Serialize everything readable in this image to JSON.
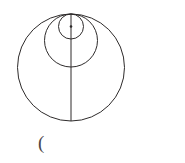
{
  "figure": {
    "caption_text": "(",
    "caption_x": 38,
    "caption_y": 133,
    "background_color": "#ffffff",
    "stroke_color": "#2e2b2b",
    "caption_color": "#4a4646"
  },
  "chart_data": {
    "type": "diagram",
    "title": "",
    "subtitle": "",
    "xlabel": "",
    "ylabel": "",
    "grid": false,
    "legend": null,
    "coordinate_space": {
      "width": 185,
      "height": 163,
      "origin": "top-left",
      "units": "pixels"
    },
    "tangent_point": {
      "label": "top tangent point",
      "x": 71,
      "y": 14
    },
    "circles": [
      {
        "name": "large-circle",
        "cx": 71,
        "cy": 67.5,
        "r": 53.5,
        "diameter": 107,
        "stroke_width": 1.0,
        "top_y": 14,
        "bottom_y": 121
      },
      {
        "name": "middle-circle",
        "cx": 71,
        "cy": 40.5,
        "r": 26.5,
        "diameter": 53,
        "stroke_width": 1.0,
        "top_y": 14,
        "bottom_y": 67
      },
      {
        "name": "small-circle",
        "cx": 71,
        "cy": 26.5,
        "r": 12.5,
        "diameter": 25,
        "stroke_width": 1.0,
        "top_y": 14,
        "bottom_y": 39
      }
    ],
    "points": [
      {
        "name": "small-circle-center-dot",
        "x": 71,
        "y": 26.5,
        "radius": 1.3,
        "marker": "filled-dot"
      }
    ],
    "lines": [
      {
        "name": "vertical-diameter",
        "x1": 71,
        "y1": 14,
        "x2": 71,
        "y2": 121,
        "stroke_width": 1.0,
        "orientation": "vertical"
      }
    ]
  }
}
